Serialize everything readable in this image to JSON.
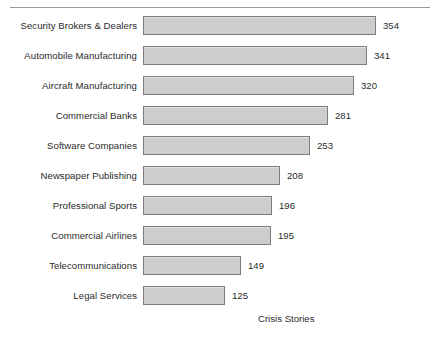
{
  "chart_data": {
    "type": "bar",
    "orientation": "horizontal",
    "title": "",
    "subtitle": "",
    "xlabel": "Crisis Stories",
    "ylabel": "",
    "grid": false,
    "legend": null,
    "legend_position": "none",
    "xlim": [
      0,
      354
    ],
    "value_labels_shown": true,
    "sorted": "descending",
    "categories": [
      "Security Brokers & Dealers",
      "Automobile Manufacturing",
      "Aircraft Manufacturing",
      "Commercial Banks",
      "Software Companies",
      "Newspaper Publishing",
      "Professional Sports",
      "Commercial Airlines",
      "Telecommunications",
      "Legal Services"
    ],
    "values": [
      354,
      341,
      320,
      281,
      253,
      208,
      196,
      195,
      149,
      125
    ],
    "value_label_texts": [
      "354",
      "341",
      "320",
      "281",
      "253",
      "208",
      "196",
      "195",
      "149",
      "125"
    ],
    "series": [
      {
        "name": "Crisis Stories",
        "values": [
          354,
          341,
          320,
          281,
          253,
          208,
          196,
          195,
          149,
          125
        ]
      }
    ]
  },
  "style": {
    "bar_fill": "#cdcdcd",
    "bar_border": "#7d7d7d",
    "text_color": "#2b2b2b",
    "rule_color": "#9a9a9a",
    "background": "#ffffff"
  },
  "axis": {
    "caption": "Crisis Stories"
  }
}
